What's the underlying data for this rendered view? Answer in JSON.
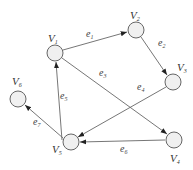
{
  "diagram": {
    "type": "directed-graph",
    "nodes": [
      {
        "id": "V1",
        "base": "V",
        "sub": "1",
        "x": 55,
        "y": 53
      },
      {
        "id": "V2",
        "base": "V",
        "sub": "2",
        "x": 136,
        "y": 30
      },
      {
        "id": "V3",
        "base": "V",
        "sub": "3",
        "x": 173,
        "y": 82
      },
      {
        "id": "V4",
        "base": "V",
        "sub": "4",
        "x": 174,
        "y": 140
      },
      {
        "id": "V5",
        "base": "V",
        "sub": "5",
        "x": 71,
        "y": 142
      },
      {
        "id": "V6",
        "base": "V",
        "sub": "6",
        "x": 18,
        "y": 99
      }
    ],
    "edges": [
      {
        "id": "e1",
        "base": "e",
        "sub": "1",
        "from": "V1",
        "to": "V2"
      },
      {
        "id": "e2",
        "base": "e",
        "sub": "2",
        "from": "V2",
        "to": "V3"
      },
      {
        "id": "e3",
        "base": "e",
        "sub": "3",
        "from": "V1",
        "to": "V4"
      },
      {
        "id": "e4",
        "base": "e",
        "sub": "4",
        "from": "V3",
        "to": "V5"
      },
      {
        "id": "e5",
        "base": "e",
        "sub": "5",
        "from": "V5",
        "to": "V1"
      },
      {
        "id": "e6",
        "base": "e",
        "sub": "6",
        "from": "V4",
        "to": "V5"
      },
      {
        "id": "e7",
        "base": "e",
        "sub": "7",
        "from": "V5",
        "to": "V6"
      }
    ]
  }
}
